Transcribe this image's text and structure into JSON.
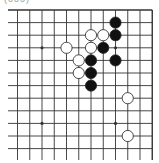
{
  "diagram": {
    "type": "go-board-corner",
    "label": "(000)",
    "region": "top-right",
    "colors": {
      "line": "#333333",
      "black_stone": "#111111",
      "white_stone": "#ffffff",
      "background": "#ffffff"
    },
    "grid": {
      "cols": 12,
      "rows": 12,
      "x0": 17.5,
      "dx": 12.25,
      "y0": 10,
      "dy": 12.6
    },
    "star_points": [
      [
        2,
        3
      ],
      [
        8,
        3
      ],
      [
        2,
        9
      ],
      [
        8,
        9
      ]
    ],
    "stones": [
      {
        "color": "black",
        "col": 8,
        "row": 1
      },
      {
        "color": "black",
        "col": 8,
        "row": 2
      },
      {
        "color": "white",
        "col": 6,
        "row": 2
      },
      {
        "color": "white",
        "col": 7,
        "row": 2
      },
      {
        "color": "white",
        "col": 4,
        "row": 3
      },
      {
        "color": "white",
        "col": 6,
        "row": 3
      },
      {
        "color": "black",
        "col": 7,
        "row": 3
      },
      {
        "color": "white",
        "col": 5,
        "row": 4
      },
      {
        "color": "black",
        "col": 6,
        "row": 4
      },
      {
        "color": "black",
        "col": 8,
        "row": 4
      },
      {
        "color": "white",
        "col": 5,
        "row": 5
      },
      {
        "color": "black",
        "col": 6,
        "row": 5
      },
      {
        "color": "black",
        "col": 6,
        "row": 6
      },
      {
        "color": "white",
        "col": 9,
        "row": 7
      },
      {
        "color": "white",
        "col": 9,
        "row": 10
      }
    ]
  }
}
